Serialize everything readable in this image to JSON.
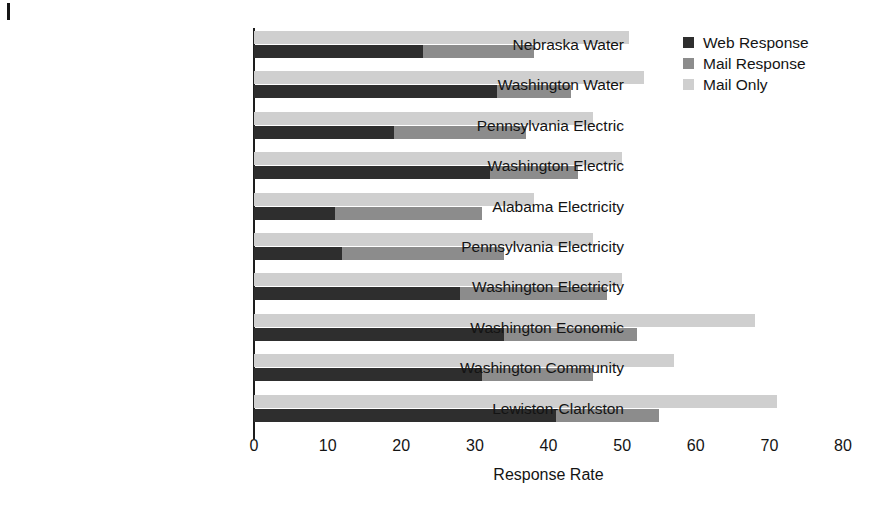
{
  "chart_data": {
    "type": "bar",
    "orientation": "horizontal",
    "title": "",
    "subtitle": "",
    "xlabel": "Response Rate",
    "ylabel": "",
    "xlim": [
      0,
      80
    ],
    "xticks": [
      0,
      10,
      20,
      30,
      40,
      50,
      60,
      70,
      80
    ],
    "grid": false,
    "legend_position": "top-right",
    "legend": [
      "Web Response",
      "Mail Response",
      "Mail Only"
    ],
    "series": [
      {
        "name": "Web Response",
        "color": "#2e2e2e",
        "stack": "response",
        "values": [
          23,
          33,
          19,
          32,
          11,
          12,
          28,
          34,
          31,
          41
        ]
      },
      {
        "name": "Mail Response",
        "color": "#8c8c8c",
        "stack": "response",
        "values": [
          15,
          10,
          18,
          12,
          20,
          22,
          20,
          18,
          15,
          14
        ]
      },
      {
        "name": "Mail Only",
        "color": "#cfcfcf",
        "stack": "mailonly",
        "values": [
          51,
          53,
          46,
          50,
          38,
          46,
          50,
          68,
          57,
          71
        ]
      }
    ],
    "categories": [
      "Nebraska Water",
      "Washington Water",
      "Pennsylvania Electric",
      "Washington Electric",
      "Alabama Electricity",
      "Pennsylvania Electricity",
      "Washington Electricity",
      "Washington Economic",
      "Washington Community",
      "Lewiston-Clarkston"
    ],
    "stacked_totals": [
      38,
      43,
      37,
      44,
      31,
      34,
      48,
      52,
      46,
      55
    ]
  },
  "colors": {
    "web_response": "#2e2e2e",
    "mail_response": "#8c8c8c",
    "mail_only": "#cfcfcf",
    "axis": "#1d1d1d",
    "text": "#141414",
    "background": "#ffffff"
  }
}
